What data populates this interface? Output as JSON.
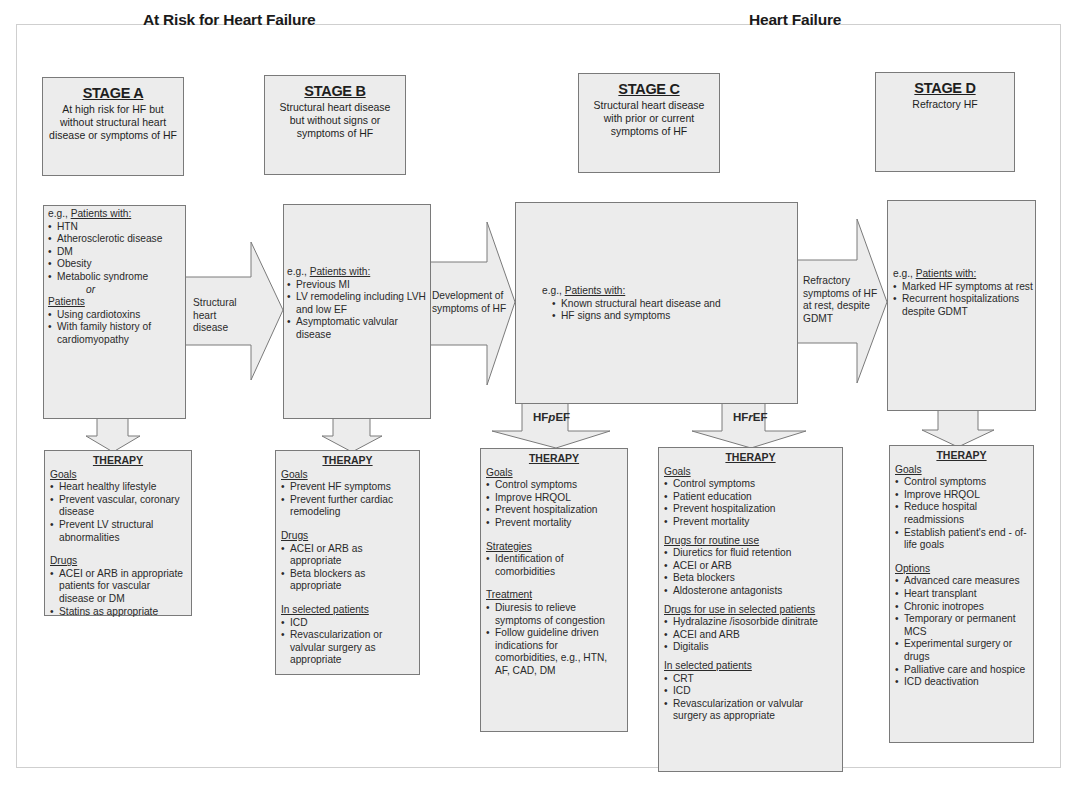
{
  "groups": {
    "at_risk": "At Risk for Heart Failure",
    "heart_failure": "Heart Failure"
  },
  "stages": [
    {
      "title": "STAGE A",
      "description": "At high risk for HF but without structural heart disease or symptoms of HF"
    },
    {
      "title": "STAGE B",
      "description": "Structural heart disease but without signs or symptoms of HF"
    },
    {
      "title": "STAGE C",
      "description": "Structural heart disease with prior or current symptoms of HF"
    },
    {
      "title": "STAGE D",
      "description": "Refractory HF"
    }
  ],
  "patients": {
    "prefix": "e.g., ",
    "heading": "Patients with:",
    "a": {
      "items": [
        "HTN",
        "Atherosclerotic disease",
        "DM",
        "Obesity",
        "Metabolic syndrome"
      ],
      "or": "or",
      "heading2": "Patients",
      "items2": [
        "Using cardiotoxins",
        "With family history of cardiomyopathy"
      ]
    },
    "b": {
      "items": [
        "Previous MI",
        "LV remodeling including LVH and low EF",
        "Asymptomatic valvular disease"
      ]
    },
    "c": {
      "items": [
        "Known structural heart disease and",
        "HF signs and symptoms"
      ]
    },
    "d": {
      "items": [
        "Marked HF symptoms at rest",
        "Recurrent hospitalizations despite GDMT"
      ]
    }
  },
  "transitions": {
    "a_to_b": "Structural heart disease",
    "b_to_c": "Development of symptoms of HF",
    "c_to_d": "Refractory symptoms of HF at rest, despite GDMT",
    "hfpef": {
      "pre": "HF",
      "em": "p",
      "post": "EF"
    },
    "hfref": {
      "pre": "HF",
      "em": "r",
      "post": "EF"
    }
  },
  "therapy": {
    "title": "THERAPY",
    "a": {
      "goals_label": "Goals",
      "goals": [
        "Heart healthy lifestyle",
        "Prevent vascular, coronary disease",
        "Prevent LV structural abnormalities"
      ],
      "drugs_label": "Drugs",
      "drugs": [
        "ACEI or ARB in appropriate patients for vascular disease or DM",
        "Statins as appropriate"
      ]
    },
    "b": {
      "goals_label": "Goals",
      "goals": [
        "Prevent HF symptoms",
        "Prevent further cardiac remodeling"
      ],
      "drugs_label": "Drugs",
      "drugs": [
        "ACEI or ARB  as appropriate",
        "Beta blockers as appropriate"
      ],
      "selected_label": "In selected patients",
      "selected": [
        "ICD",
        "Revascularization or valvular surgery as appropriate"
      ]
    },
    "c_pef": {
      "goals_label": "Goals",
      "goals": [
        "Control symptoms",
        "Improve HRQOL",
        "Prevent hospitalization",
        "Prevent mortality"
      ],
      "strategies_label": "Strategies",
      "strategies": [
        "Identification of comorbidities"
      ],
      "treatment_label": "Treatment",
      "treatment": [
        "Diuresis to relieve symptoms of congestion",
        "Follow guideline driven indications for comorbidities, e.g., HTN, AF, CAD, DM"
      ]
    },
    "c_ref": {
      "goals_label": "Goals",
      "goals": [
        "Control symptoms",
        "Patient education",
        "Prevent hospitalization",
        "Prevent mortality"
      ],
      "routine_label": "Drugs for routine use",
      "routine": [
        "Diuretics for fluid retention",
        "ACEI or ARB",
        "Beta blockers",
        "Aldosterone antagonists"
      ],
      "sel_drugs_label": "Drugs for use in selected patients",
      "sel_drugs": [
        "Hydralazine /isosorbide dinitrate",
        "ACEI and ARB",
        "Digitalis"
      ],
      "selected_label": "In selected patients",
      "selected": [
        "CRT",
        "ICD",
        "Revascularization or valvular surgery as appropriate"
      ]
    },
    "d": {
      "goals_label": "Goals",
      "goals": [
        "Control symptoms",
        "Improve HRQOL",
        "Reduce hospital readmissions",
        "Establish patient's end - of-life goals"
      ],
      "options_label": "Options",
      "options": [
        "Advanced care measures",
        "Heart transplant",
        "Chronic inotropes",
        "Temporary or permanent MCS",
        "Experimental surgery or drugs",
        "Palliative care and hospice",
        "ICD deactivation"
      ]
    }
  },
  "colors": {
    "box_fill": "#ececec",
    "box_border": "#7a7a7a",
    "text": "#2a2a2a"
  }
}
